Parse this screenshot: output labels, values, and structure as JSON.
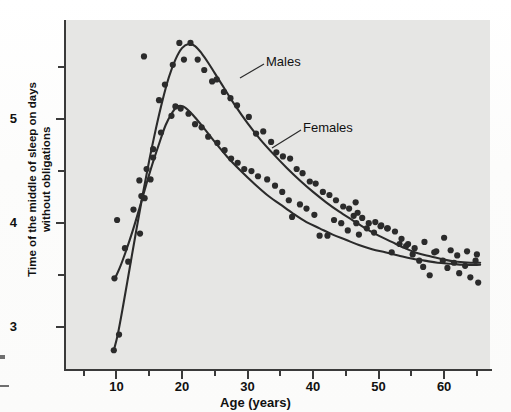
{
  "chart_data": {
    "type": "scatter",
    "title": "",
    "xlabel": "Age (years)",
    "ylabel": "Time of the middle of sleep on days without obligations",
    "xlim": [
      2,
      67
    ],
    "ylim": [
      2.6,
      5.95
    ],
    "grid": false,
    "legend_position": "inline-annotation",
    "x_ticks_major": [
      10,
      20,
      30,
      40,
      50,
      60
    ],
    "x_ticks_minor": [
      5,
      15,
      25,
      35,
      45,
      55,
      65
    ],
    "y_ticks_major": [
      3,
      4,
      5
    ],
    "y_ticks_minor": [
      3.5,
      4.5,
      5.5
    ],
    "annotations": [
      {
        "text": "Males",
        "x": 30.5,
        "y": 5.45
      },
      {
        "text": "Females",
        "x": 36.5,
        "y": 4.78
      }
    ],
    "series": [
      {
        "name": "Males",
        "color": "#2b2b2b",
        "fit_curve": [
          [
            9.6,
            2.78
          ],
          [
            10.2,
            2.93
          ],
          [
            11.0,
            3.2
          ],
          [
            12.0,
            3.56
          ],
          [
            13.0,
            3.92
          ],
          [
            14.0,
            4.27
          ],
          [
            15.0,
            4.6
          ],
          [
            16.0,
            4.9
          ],
          [
            17.0,
            5.17
          ],
          [
            18.0,
            5.4
          ],
          [
            19.0,
            5.57
          ],
          [
            20.0,
            5.68
          ],
          [
            21.0,
            5.72
          ],
          [
            22.0,
            5.7
          ],
          [
            23.0,
            5.63
          ],
          [
            24.0,
            5.54
          ],
          [
            25.0,
            5.44
          ],
          [
            26.5,
            5.29
          ],
          [
            28.0,
            5.14
          ],
          [
            30.0,
            4.96
          ],
          [
            32.0,
            4.8
          ],
          [
            34.0,
            4.66
          ],
          [
            36.0,
            4.53
          ],
          [
            38.0,
            4.41
          ],
          [
            40.0,
            4.3
          ],
          [
            42.0,
            4.2
          ],
          [
            44.0,
            4.11
          ],
          [
            46.0,
            4.03
          ],
          [
            48.0,
            3.95
          ],
          [
            50.0,
            3.88
          ],
          [
            52.0,
            3.82
          ],
          [
            54.0,
            3.76
          ],
          [
            56.0,
            3.71
          ],
          [
            58.0,
            3.68
          ],
          [
            60.0,
            3.65
          ],
          [
            62.0,
            3.63
          ],
          [
            64.0,
            3.62
          ],
          [
            65.5,
            3.62
          ]
        ],
        "points": [
          [
            9.6,
            2.78
          ],
          [
            10.4,
            2.93
          ],
          [
            13.6,
            3.9
          ],
          [
            14.3,
            4.24
          ],
          [
            14.6,
            4.52
          ],
          [
            15.6,
            4.63
          ],
          [
            16.5,
            5.18
          ],
          [
            17.4,
            5.33
          ],
          [
            14.2,
            5.6
          ],
          [
            18.6,
            5.52
          ],
          [
            19.6,
            5.73
          ],
          [
            21.3,
            5.73
          ],
          [
            20.3,
            5.57
          ],
          [
            22.4,
            5.57
          ],
          [
            23.4,
            5.47
          ],
          [
            24.6,
            5.36
          ],
          [
            25.3,
            5.38
          ],
          [
            26.4,
            5.26
          ],
          [
            27.4,
            5.2
          ],
          [
            28.4,
            5.13
          ],
          [
            30.2,
            5.02
          ],
          [
            31.3,
            4.86
          ],
          [
            32.4,
            4.88
          ],
          [
            33.6,
            4.78
          ],
          [
            34.4,
            4.68
          ],
          [
            35.4,
            4.64
          ],
          [
            36.5,
            4.62
          ],
          [
            37.5,
            4.52
          ],
          [
            38.4,
            4.48
          ],
          [
            39.5,
            4.4
          ],
          [
            40.4,
            4.38
          ],
          [
            41.5,
            4.3
          ],
          [
            42.5,
            4.27
          ],
          [
            43.5,
            4.22
          ],
          [
            44.6,
            4.16
          ],
          [
            45.5,
            4.14
          ],
          [
            46.5,
            4.2
          ],
          [
            46.8,
            4.1
          ],
          [
            47.5,
            4.05
          ],
          [
            48.5,
            4.0
          ],
          [
            49.5,
            4.01
          ],
          [
            50.4,
            3.98
          ],
          [
            51.4,
            3.95
          ],
          [
            52.5,
            3.92
          ],
          [
            53.5,
            3.85
          ],
          [
            54.5,
            3.8
          ],
          [
            55.5,
            3.76
          ],
          [
            57.0,
            3.82
          ],
          [
            58.5,
            3.72
          ],
          [
            60.0,
            3.86
          ],
          [
            61.0,
            3.74
          ],
          [
            62.0,
            3.69
          ],
          [
            63.5,
            3.73
          ],
          [
            65.0,
            3.7
          ]
        ]
      },
      {
        "name": "Females",
        "color": "#2b2b2b",
        "fit_curve": [
          [
            9.7,
            3.46
          ],
          [
            10.5,
            3.57
          ],
          [
            11.5,
            3.74
          ],
          [
            12.5,
            3.93
          ],
          [
            13.5,
            4.14
          ],
          [
            14.5,
            4.36
          ],
          [
            15.5,
            4.57
          ],
          [
            16.5,
            4.76
          ],
          [
            17.5,
            4.94
          ],
          [
            18.5,
            5.06
          ],
          [
            19.3,
            5.12
          ],
          [
            20.2,
            5.12
          ],
          [
            21.2,
            5.07
          ],
          [
            22.2,
            5.0
          ],
          [
            23.5,
            4.9
          ],
          [
            25.0,
            4.78
          ],
          [
            27.0,
            4.63
          ],
          [
            29.0,
            4.5
          ],
          [
            31.0,
            4.38
          ],
          [
            33.0,
            4.27
          ],
          [
            35.0,
            4.18
          ],
          [
            37.0,
            4.09
          ],
          [
            39.0,
            4.01
          ],
          [
            41.0,
            3.95
          ],
          [
            43.0,
            3.89
          ],
          [
            45.0,
            3.84
          ],
          [
            47.0,
            3.79
          ],
          [
            49.0,
            3.75
          ],
          [
            51.0,
            3.72
          ],
          [
            53.0,
            3.69
          ],
          [
            55.0,
            3.66
          ],
          [
            57.0,
            3.64
          ],
          [
            59.0,
            3.62
          ],
          [
            61.0,
            3.61
          ],
          [
            63.0,
            3.6
          ],
          [
            65.5,
            3.6
          ]
        ],
        "points": [
          [
            9.7,
            3.47
          ],
          [
            10.1,
            4.03
          ],
          [
            11.3,
            3.76
          ],
          [
            11.8,
            3.63
          ],
          [
            12.6,
            4.13
          ],
          [
            13.5,
            4.41
          ],
          [
            13.8,
            4.26
          ],
          [
            15.2,
            4.42
          ],
          [
            15.6,
            4.71
          ],
          [
            16.8,
            4.87
          ],
          [
            18.4,
            5.03
          ],
          [
            19.0,
            5.12
          ],
          [
            19.8,
            5.1
          ],
          [
            21.0,
            5.05
          ],
          [
            22.0,
            4.95
          ],
          [
            23.0,
            4.92
          ],
          [
            24.0,
            4.83
          ],
          [
            25.4,
            4.77
          ],
          [
            26.5,
            4.7
          ],
          [
            27.5,
            4.62
          ],
          [
            28.5,
            4.58
          ],
          [
            29.5,
            4.52
          ],
          [
            30.6,
            4.5
          ],
          [
            31.6,
            4.45
          ],
          [
            33.0,
            4.42
          ],
          [
            34.2,
            4.36
          ],
          [
            35.3,
            4.3
          ],
          [
            36.3,
            4.22
          ],
          [
            36.8,
            4.06
          ],
          [
            38.0,
            4.18
          ],
          [
            39.0,
            4.14
          ],
          [
            40.2,
            4.08
          ],
          [
            41.0,
            3.88
          ],
          [
            42.2,
            3.88
          ],
          [
            43.2,
            4.03
          ],
          [
            44.3,
            4.0
          ],
          [
            45.3,
            3.93
          ],
          [
            46.2,
            4.07
          ],
          [
            46.6,
            4.0
          ],
          [
            47.0,
            3.89
          ],
          [
            48.2,
            3.95
          ],
          [
            49.3,
            3.91
          ],
          [
            50.3,
            3.97
          ],
          [
            51.3,
            3.95
          ],
          [
            52.0,
            3.72
          ],
          [
            53.2,
            3.8
          ],
          [
            54.2,
            3.78
          ],
          [
            55.2,
            3.7
          ],
          [
            56.2,
            3.64
          ],
          [
            56.8,
            3.58
          ],
          [
            57.8,
            3.5
          ],
          [
            58.8,
            3.73
          ],
          [
            59.8,
            3.64
          ],
          [
            60.5,
            3.57
          ],
          [
            61.5,
            3.62
          ],
          [
            62.3,
            3.52
          ],
          [
            63.2,
            3.59
          ],
          [
            64.0,
            3.48
          ],
          [
            65.2,
            3.43
          ],
          [
            64.8,
            3.64
          ]
        ]
      }
    ]
  },
  "axis": {
    "y_tick_labels": [
      "5",
      "4",
      "3"
    ],
    "x_tick_labels": [
      "10",
      "20",
      "30",
      "40",
      "50",
      "60"
    ],
    "y_title": "Time of the middle of sleep on days without obligations",
    "x_title": "Age (years)"
  },
  "labels": {
    "males": "Males",
    "females": "Females"
  },
  "colors": {
    "ink": "#2b2b2b",
    "plot_background": "#e6e6e4",
    "page_background": "#fdfdfd"
  }
}
